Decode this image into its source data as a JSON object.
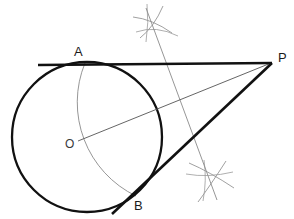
{
  "figure": {
    "type": "euclidean-construction-diagram",
    "canvas": {
      "width": 294,
      "height": 219,
      "background": "#ffffff"
    },
    "colors": {
      "primary_ink": "#111111",
      "construction_ink": "#8a8a8a",
      "label_ink": "#1b1b1b"
    },
    "labels": {
      "point_a": "A",
      "point_b": "B",
      "point_o": "O",
      "point_p": "P"
    },
    "points": {
      "A": {
        "x": 85,
        "y": 63,
        "label_x": 77,
        "label_y": 54
      },
      "B": {
        "x": 136,
        "y": 196,
        "label_x": 139,
        "label_y": 208
      },
      "O": {
        "x": 87,
        "y": 137,
        "label_x": 68,
        "label_y": 148
      },
      "P": {
        "x": 272,
        "y": 63,
        "label_x": 279,
        "label_y": 60
      },
      "M": {
        "x": 180,
        "y": 100
      },
      "arc_cross_top": {
        "x": 151,
        "y": 23
      },
      "arc_cross_bottom": {
        "x": 212,
        "y": 182
      }
    },
    "main_circle": {
      "cx": 87,
      "cy": 137,
      "r": 75,
      "stroke_width": 2.4
    },
    "thales_arc": {
      "cx": 180,
      "cy": 100,
      "r": 104,
      "description": "arc on diameter OP through A and B",
      "stroke_width": 0.9
    },
    "segments": [
      {
        "name": "tangent-AP",
        "x1": 38,
        "y1": 65,
        "x2": 272,
        "y2": 63,
        "weight": "heavy"
      },
      {
        "name": "tangent-BP",
        "x1": 113,
        "y1": 213,
        "x2": 272,
        "y2": 63,
        "weight": "heavy"
      },
      {
        "name": "radius-line-OP",
        "x1": 75,
        "y1": 142,
        "x2": 272,
        "y2": 63,
        "weight": "light"
      },
      {
        "name": "perpendicular-bisector-OP",
        "x1": 146,
        "y1": 8,
        "x2": 216,
        "y2": 199,
        "weight": "light"
      }
    ],
    "construction_arcs": [
      {
        "name": "compass-arc-top-1",
        "x1": 133,
        "y1": 17,
        "x2": 172,
        "y2": 33,
        "bow": -6
      },
      {
        "name": "compass-arc-top-2",
        "x1": 140,
        "y1": 38,
        "x2": 163,
        "y2": 6,
        "bow": 5
      },
      {
        "name": "compass-arc-bottom-1",
        "x1": 190,
        "y1": 166,
        "x2": 232,
        "y2": 189,
        "bow": -6
      },
      {
        "name": "compass-arc-bottom-2",
        "x1": 198,
        "y1": 200,
        "x2": 224,
        "y2": 163,
        "bow": 5
      }
    ]
  }
}
